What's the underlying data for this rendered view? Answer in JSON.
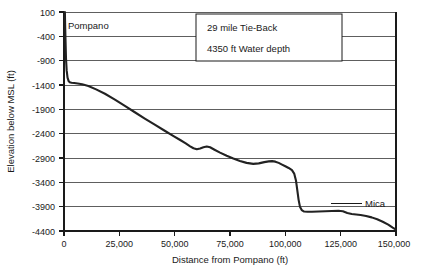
{
  "chart_data": {
    "type": "line",
    "title": "",
    "xlabel": "Distance from Pompano (ft)",
    "ylabel": "Elevation below MSL (ft)",
    "xlim": [
      0,
      150000
    ],
    "ylim": [
      -4400,
      100
    ],
    "xticks": [
      0,
      25000,
      50000,
      75000,
      100000,
      125000,
      150000
    ],
    "xticklabels": [
      "0",
      "25,000",
      "50,000",
      "75,000",
      "100,000",
      "125,000",
      "150,000"
    ],
    "yticks": [
      100,
      -400,
      -900,
      -1400,
      -1900,
      -2400,
      -2900,
      -3400,
      -3900,
      -4400
    ],
    "yticklabels": [
      "100",
      "-400",
      "-900",
      "-1400",
      "-1900",
      "-2400",
      "-2900",
      "-3400",
      "-3900",
      "-4400"
    ],
    "grid": "horizontal",
    "legend": "none",
    "series": [
      {
        "name": "Pipeline profile",
        "color": "#222222",
        "x": [
          400,
          500,
          700,
          900,
          1200,
          1600,
          2100,
          2600,
          3400,
          4600,
          6200,
          8200,
          11000,
          14500,
          18500,
          23000,
          27500,
          32000,
          36500,
          41000,
          45500,
          49500,
          52500,
          55000,
          57000,
          58500,
          60000,
          61500,
          63000,
          64500,
          66000,
          68000,
          70500,
          73500,
          76500,
          79500,
          82500,
          85500,
          88000,
          90500,
          92500,
          94000,
          95500,
          97000,
          98500,
          100000,
          101500,
          103000,
          104000,
          104800,
          105400,
          106000,
          106600,
          107400,
          108500,
          110000,
          112000,
          115000,
          118000,
          121000,
          124000,
          126000,
          128000,
          130000,
          132000,
          134000,
          136500,
          139000,
          141500,
          144000,
          146500,
          148500,
          150000
        ],
        "y": [
          100,
          -150,
          -500,
          -850,
          -1100,
          -1250,
          -1320,
          -1345,
          -1355,
          -1360,
          -1370,
          -1385,
          -1420,
          -1490,
          -1580,
          -1700,
          -1830,
          -1960,
          -2090,
          -2215,
          -2340,
          -2450,
          -2530,
          -2600,
          -2660,
          -2700,
          -2720,
          -2705,
          -2680,
          -2665,
          -2680,
          -2730,
          -2790,
          -2855,
          -2910,
          -2960,
          -3000,
          -3020,
          -3010,
          -2985,
          -2970,
          -2965,
          -2975,
          -3000,
          -3035,
          -3070,
          -3105,
          -3150,
          -3220,
          -3360,
          -3560,
          -3760,
          -3900,
          -3970,
          -4000,
          -4005,
          -4005,
          -4000,
          -3995,
          -3990,
          -3985,
          -3995,
          -4030,
          -4050,
          -4060,
          -4070,
          -4090,
          -4120,
          -4160,
          -4210,
          -4270,
          -4330,
          -4370
        ]
      }
    ],
    "annotations": {
      "start_point_label": "Pompano",
      "end_point_label": "Mica",
      "textbox_lines": [
        "29 mile Tie-Back",
        "4350 ft Water depth"
      ]
    }
  }
}
